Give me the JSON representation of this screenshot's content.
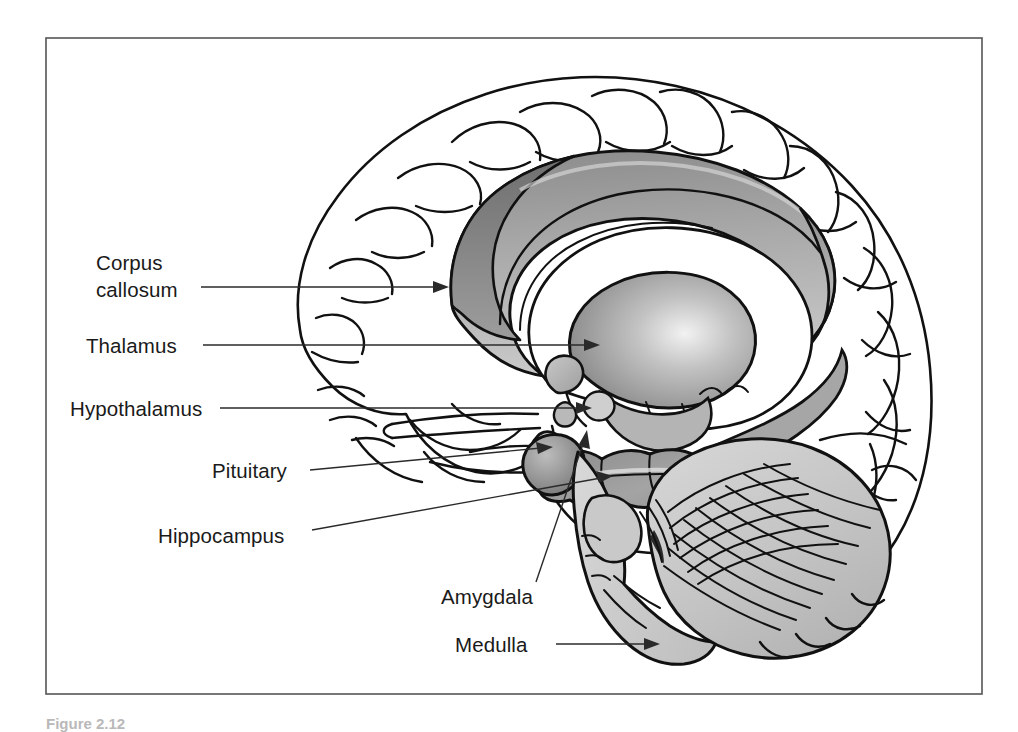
{
  "figure": {
    "caption": "Figure 2.12",
    "frame": {
      "border_color": "#555555",
      "x": 46,
      "y": 38,
      "width": 936,
      "height": 656
    },
    "background_color": "#ffffff"
  },
  "palette": {
    "ink": "#111111",
    "leader": "#2a2a2a",
    "label": "#1a1a1a",
    "corpus_callosum_fill": "#9a9a9a",
    "corpus_callosum_dark": "#7d7d7d",
    "thalamus_fill": "#a8a8a8",
    "hippocampus_fill": "#8f8f8f",
    "cerebellum_fill": "#c6c6c6",
    "brainstem_fill": "#cfcfcf",
    "cortex_fill": "#ffffff"
  },
  "labels": [
    {
      "id": "corpus-callosum",
      "lines": [
        "Corpus",
        "callosum"
      ],
      "text_x": 96,
      "text_y": 270,
      "line_height": 27,
      "leader": {
        "x1": 201,
        "y1": 287,
        "x2": 437,
        "y2": 287
      },
      "arrow": {
        "x": 449,
        "y": 287,
        "angle": 0
      }
    },
    {
      "id": "thalamus",
      "lines": [
        "Thalamus"
      ],
      "text_x": 86,
      "text_y": 353,
      "line_height": 27,
      "leader": {
        "x1": 203,
        "y1": 345,
        "x2": 588,
        "y2": 345
      },
      "arrow": {
        "x": 600,
        "y": 345,
        "angle": 0
      }
    },
    {
      "id": "hypothalamus",
      "lines": [
        "Hypothalamus"
      ],
      "text_x": 70,
      "text_y": 416,
      "line_height": 27,
      "leader": {
        "x1": 220,
        "y1": 408,
        "x2": 580,
        "y2": 408
      },
      "arrow": {
        "x": 592,
        "y": 408,
        "angle": 0
      }
    },
    {
      "id": "pituitary",
      "lines": [
        "Pituitary"
      ],
      "text_x": 212,
      "text_y": 478,
      "line_height": 27,
      "leader": {
        "x1": 310,
        "y1": 470,
        "x2": 540,
        "y2": 448
      },
      "arrow": {
        "x": 552,
        "y": 447,
        "angle": -5
      }
    },
    {
      "id": "hippocampus",
      "lines": [
        "Hippocampus"
      ],
      "text_x": 158,
      "text_y": 543,
      "line_height": 27,
      "leader": {
        "x1": 312,
        "y1": 530,
        "x2": 600,
        "y2": 478
      },
      "arrow": {
        "x": 612,
        "y": 476,
        "angle": -10
      }
    },
    {
      "id": "amygdala",
      "lines": [
        "Amygdala"
      ],
      "text_x": 441,
      "text_y": 604,
      "line_height": 27,
      "leader": {
        "x1": 536,
        "y1": 582,
        "x2": 584,
        "y2": 441
      },
      "arrow": {
        "x": 586,
        "y": 430,
        "angle": -72
      }
    },
    {
      "id": "medulla",
      "lines": [
        "Medulla"
      ],
      "text_x": 455,
      "text_y": 652,
      "line_height": 27,
      "leader": {
        "x1": 556,
        "y1": 644,
        "x2": 648,
        "y2": 644
      },
      "arrow": {
        "x": 660,
        "y": 644,
        "angle": 0
      }
    }
  ],
  "structures": [
    {
      "id": "cerebral-cortex",
      "name": "Cerebral cortex"
    },
    {
      "id": "corpus-callosum",
      "name": "Corpus callosum"
    },
    {
      "id": "cingulate-gyrus",
      "name": "Cingulate gyrus"
    },
    {
      "id": "thalamus",
      "name": "Thalamus"
    },
    {
      "id": "hypothalamus",
      "name": "Hypothalamus"
    },
    {
      "id": "pituitary-gland",
      "name": "Pituitary gland"
    },
    {
      "id": "hippocampus",
      "name": "Hippocampus"
    },
    {
      "id": "amygdala",
      "name": "Amygdala"
    },
    {
      "id": "cerebellum",
      "name": "Cerebellum"
    },
    {
      "id": "medulla",
      "name": "Medulla"
    },
    {
      "id": "brainstem",
      "name": "Brainstem"
    }
  ]
}
